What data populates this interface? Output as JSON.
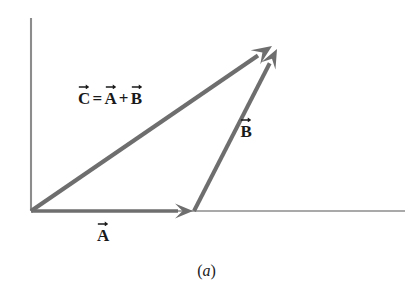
{
  "figure": {
    "caption": "(a)",
    "caption_paren_open": "(",
    "caption_letter": "a",
    "caption_paren_close": ")",
    "background_color": "#ffffff",
    "vector_color": "#6e6e6e",
    "axis_color": "#8c8c8c",
    "text_color": "#1a1a1a"
  },
  "axes": {
    "name": "coordinate-axes",
    "vertical": {
      "label": "",
      "x1": 31,
      "y1": 18,
      "x2": 31,
      "y2": 211
    },
    "horizontal": {
      "label": "",
      "x1": 31,
      "y1": 211,
      "x2": 405,
      "y2": 211
    }
  },
  "labels": {
    "equation": {
      "text": "C = A + B",
      "c": "C",
      "equals": "=",
      "a": "A",
      "plus": "+",
      "b": "B"
    },
    "vector_a": "A",
    "vector_b": "B"
  },
  "chart_data": {
    "type": "diagram",
    "subtitle": "(a)",
    "xlabel": "",
    "ylabel": "",
    "grid": false,
    "legend": "none",
    "origin": {
      "x": 31,
      "y": 211
    },
    "axis_ranges": {
      "x": [
        31,
        405
      ],
      "y": [
        18,
        211
      ]
    },
    "vectors": [
      {
        "name": "A",
        "label": "A",
        "label_text": "A",
        "start": {
          "x": 31,
          "y": 211
        },
        "end": {
          "x": 193,
          "y": 211
        },
        "components": {
          "dx": 162,
          "dy": 0
        },
        "magnitude_px": 162,
        "angle_deg": 0,
        "color": "#6e6e6e",
        "label_position": {
          "x": 103,
          "y": 232
        }
      },
      {
        "name": "B",
        "label": "B",
        "label_text": "B",
        "start": {
          "x": 194,
          "y": 211
        },
        "end": {
          "x": 277,
          "y": 49
        },
        "components": {
          "dx": 83,
          "dy": -162
        },
        "magnitude_px": 182,
        "angle_deg": 62.9,
        "color": "#6e6e6e",
        "label_position": {
          "x": 246,
          "y": 128
        }
      },
      {
        "name": "C",
        "label": "C = A + B",
        "label_text": "C = A + B",
        "start": {
          "x": 31,
          "y": 211
        },
        "end": {
          "x": 272,
          "y": 46
        },
        "components": {
          "dx": 241,
          "dy": -165
        },
        "magnitude_px": 292,
        "angle_deg": 34.4,
        "color": "#6e6e6e",
        "label_position": {
          "x": 110,
          "y": 95
        }
      }
    ],
    "annotations": [
      {
        "text": "C = A + B",
        "x": 110,
        "y": 95
      },
      {
        "text": "B",
        "x": 246,
        "y": 128
      },
      {
        "text": "A",
        "x": 103,
        "y": 232
      },
      {
        "text": "(a)",
        "x": 206,
        "y": 272
      }
    ]
  }
}
